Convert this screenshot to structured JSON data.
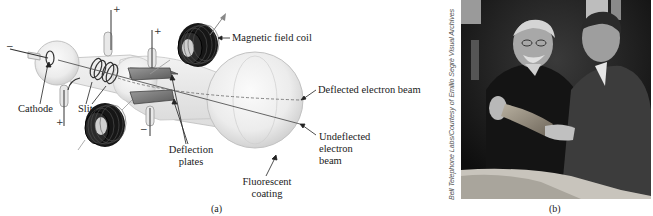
{
  "figure": {
    "panel_a": {
      "caption": "(a)",
      "labels": {
        "magnetic_field_coil": "Magnetic field coil",
        "deflected_beam": "Deflected electron beam",
        "undeflected_beam_line1": "Undeflected",
        "undeflected_beam_line2": "electron",
        "undeflected_beam_line3": "beam",
        "cathode": "Cathode",
        "slits": "Slits",
        "deflection_plates_line1": "Deflection",
        "deflection_plates_line2": "plates",
        "fluorescent_line1": "Fluorescent",
        "fluorescent_line2": "coating"
      },
      "polarity_signs": {
        "cathode_terminal": "−",
        "anode_terminal_bottom": "+",
        "slit_terminal_top": "+",
        "plate_top": "+",
        "plate_bottom": "−"
      }
    },
    "panel_b": {
      "caption": "(b)",
      "credit": "Bell Telephone Labs/Courtesy of Emilio Segrè Visual Archives"
    }
  }
}
